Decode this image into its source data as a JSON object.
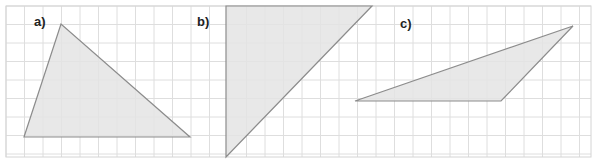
{
  "figure": {
    "grid": {
      "origin_x": 6,
      "origin_y": 6,
      "spacing": 18.5,
      "right": 591,
      "bottom": 157,
      "line_color": "#dedede",
      "border_color": "#d4d4d4"
    },
    "triangle_style": {
      "fill": "#e4e4e4",
      "stroke": "#8c8c8c"
    },
    "triangles": [
      {
        "id": "a",
        "label": "a)",
        "label_pos": [
          34,
          26
        ],
        "points": [
          [
            61,
            24
          ],
          [
            24,
            137
          ],
          [
            190,
            137
          ]
        ]
      },
      {
        "id": "b",
        "label": "b)",
        "label_pos": [
          197,
          26
        ],
        "points": [
          [
            226,
            6
          ],
          [
            372,
            6
          ],
          [
            226,
            157
          ]
        ]
      },
      {
        "id": "c",
        "label": "c)",
        "label_pos": [
          400,
          28
        ],
        "points": [
          [
            355,
            101
          ],
          [
            501,
            101
          ],
          [
            573,
            26
          ]
        ]
      }
    ]
  }
}
